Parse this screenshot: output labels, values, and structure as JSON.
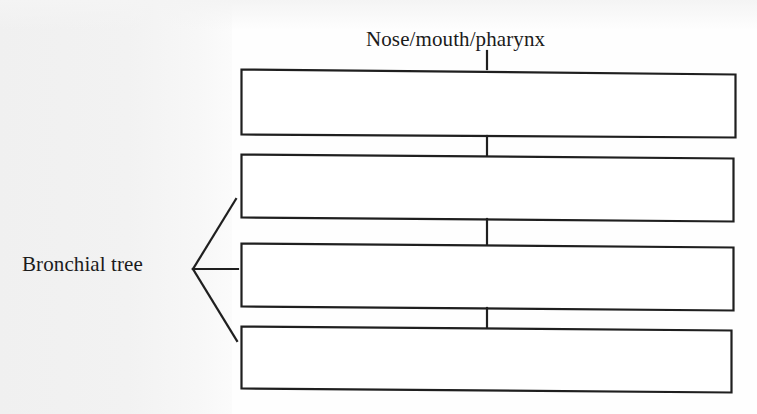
{
  "figure": {
    "type": "flowchart",
    "background_color": "#fefefe",
    "line_color": "#1f1f1f",
    "text_color": "#1b1b1b"
  },
  "labels": {
    "top": "Nose/mouth/pharynx",
    "left_bracket": "Bronchial tree"
  },
  "boxes": [
    {
      "id": "box-1",
      "text": "",
      "filled": false
    },
    {
      "id": "box-2",
      "text": "",
      "filled": false
    },
    {
      "id": "box-3",
      "text": "",
      "filled": false
    },
    {
      "id": "box-4",
      "text": "",
      "filled": false
    }
  ],
  "connectors": {
    "title_to_box1": "vertical-stub",
    "box1_to_box2": "vertical-stub",
    "box2_to_box3": "vertical-stub",
    "box3_to_box4": "vertical-stub",
    "bracket_targets": [
      "box-2",
      "box-3",
      "box-4"
    ]
  }
}
